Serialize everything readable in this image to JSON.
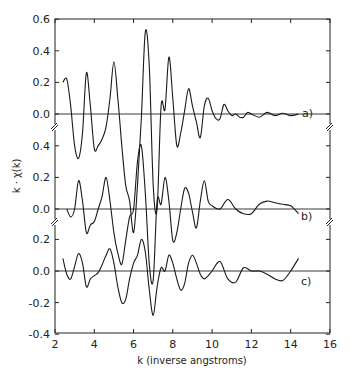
{
  "chart_data": {
    "type": "line",
    "title": "",
    "xlabel": "k (inverse angstroms)",
    "ylabel": "k · χ(k)",
    "xlim": [
      2,
      16
    ],
    "x_ticks": [
      "2",
      "4",
      "6",
      "8",
      "10",
      "12",
      "14",
      "16"
    ],
    "grid": false,
    "legend": "none (panel labels a), b), c) at right end of curves)",
    "panels": [
      {
        "label": "a)",
        "ylim": [
          -0.1,
          0.6
        ],
        "y_ticks": [
          "0.6",
          "0.4",
          "0.2",
          "0.0"
        ],
        "x": [
          2.4,
          2.6,
          2.8,
          3.0,
          3.2,
          3.4,
          3.6,
          3.8,
          4.0,
          4.2,
          4.4,
          4.6,
          4.8,
          5.0,
          5.2,
          5.4,
          5.6,
          5.8,
          6.0,
          6.2,
          6.4,
          6.6,
          6.8,
          7.0,
          7.2,
          7.4,
          7.6,
          7.8,
          8.0,
          8.2,
          8.4,
          8.6,
          8.8,
          9.0,
          9.2,
          9.4,
          9.6,
          9.8,
          10.0,
          10.2,
          10.4,
          10.6,
          10.8,
          11.0,
          11.2,
          11.4,
          11.6,
          11.8,
          12.0,
          12.4,
          12.8,
          13.2,
          13.6,
          14.0,
          14.4
        ],
        "values": [
          0.2,
          0.22,
          0.05,
          -0.2,
          -0.28,
          -0.12,
          0.26,
          0.05,
          -0.22,
          -0.2,
          -0.16,
          -0.08,
          0.1,
          0.33,
          0.1,
          -0.2,
          -0.45,
          -0.55,
          -0.75,
          -0.45,
          -0.02,
          0.52,
          0.3,
          -0.45,
          -0.6,
          0.05,
          0.03,
          0.36,
          0.1,
          -0.2,
          -0.12,
          0.02,
          0.16,
          0.05,
          -0.05,
          -0.15,
          0.05,
          0.1,
          0.02,
          -0.03,
          -0.03,
          0.06,
          0.02,
          -0.01,
          0.0,
          -0.02,
          -0.02,
          0.01,
          0.0,
          -0.02,
          0.01,
          -0.01,
          0.005,
          -0.01,
          0.0
        ]
      },
      {
        "label": "b)",
        "ylim": [
          -0.1,
          0.5
        ],
        "y_ticks": [
          "0.4",
          "0.2",
          "0.0"
        ],
        "x": [
          2.6,
          2.8,
          3.0,
          3.2,
          3.4,
          3.6,
          3.8,
          4.0,
          4.2,
          4.4,
          4.6,
          4.8,
          5.0,
          5.2,
          5.4,
          5.6,
          5.8,
          6.0,
          6.2,
          6.4,
          6.6,
          6.8,
          7.0,
          7.2,
          7.4,
          7.6,
          7.8,
          8.0,
          8.2,
          8.4,
          8.6,
          8.8,
          9.0,
          9.2,
          9.4,
          9.6,
          9.8,
          10.0,
          10.4,
          10.8,
          11.2,
          11.6,
          12.0,
          12.4,
          12.8,
          13.2,
          13.6,
          14.0,
          14.4
        ],
        "values": [
          0.0,
          -0.05,
          0.0,
          0.18,
          0.05,
          -0.15,
          -0.1,
          -0.08,
          0.0,
          0.08,
          0.2,
          0.05,
          -0.15,
          -0.28,
          -0.35,
          -0.2,
          -0.05,
          0.0,
          0.3,
          0.4,
          0.1,
          -0.35,
          -0.45,
          0.05,
          0.03,
          0.2,
          0.05,
          -0.2,
          -0.15,
          0.0,
          0.13,
          0.1,
          -0.02,
          -0.12,
          0.05,
          0.18,
          0.05,
          0.02,
          0.0,
          0.06,
          0.0,
          -0.03,
          -0.03,
          0.03,
          0.05,
          0.04,
          0.03,
          0.02,
          -0.03
        ]
      },
      {
        "label": "c)",
        "ylim": [
          -0.4,
          0.3
        ],
        "y_ticks": [
          "0.2",
          "0.0",
          "-0.2",
          "-0.4"
        ],
        "x": [
          2.4,
          2.6,
          2.8,
          3.0,
          3.2,
          3.4,
          3.6,
          3.8,
          4.0,
          4.2,
          4.4,
          4.6,
          4.8,
          5.0,
          5.2,
          5.4,
          5.6,
          5.8,
          6.0,
          6.2,
          6.4,
          6.6,
          6.8,
          7.0,
          7.2,
          7.4,
          7.6,
          7.8,
          8.0,
          8.2,
          8.4,
          8.6,
          8.8,
          9.0,
          9.2,
          9.4,
          9.6,
          9.8,
          10.0,
          10.4,
          10.8,
          11.2,
          11.6,
          12.0,
          12.4,
          12.8,
          13.2,
          13.6,
          14.0,
          14.4
        ],
        "values": [
          0.08,
          -0.02,
          -0.05,
          0.03,
          0.11,
          0.05,
          -0.1,
          -0.05,
          -0.03,
          -0.01,
          0.04,
          0.1,
          0.14,
          0.05,
          -0.1,
          -0.2,
          -0.18,
          -0.05,
          0.05,
          0.1,
          0.2,
          0.12,
          -0.12,
          -0.28,
          -0.1,
          0.02,
          0.0,
          0.1,
          0.05,
          -0.05,
          -0.12,
          -0.08,
          0.05,
          0.1,
          0.05,
          -0.02,
          -0.05,
          -0.03,
          0.0,
          0.06,
          -0.05,
          -0.07,
          0.02,
          0.0,
          0.0,
          -0.02,
          -0.05,
          -0.06,
          0.0,
          0.08
        ]
      }
    ]
  },
  "labels": {
    "xlabel": "k (inverse angstroms)",
    "ylabel": "k · χ(k)",
    "panel_a": "a)",
    "panel_b": "b)",
    "panel_c": "c)",
    "y_ticks_a": [
      "0.6",
      "0.4",
      "0.2",
      "0.0"
    ],
    "y_ticks_b": [
      "0.4",
      "0.2",
      "0.0"
    ],
    "y_ticks_c": [
      "0.2",
      "0.0",
      "-0.2",
      "-0.4"
    ],
    "x_ticks": [
      "2",
      "4",
      "6",
      "8",
      "10",
      "12",
      "14",
      "16"
    ]
  }
}
